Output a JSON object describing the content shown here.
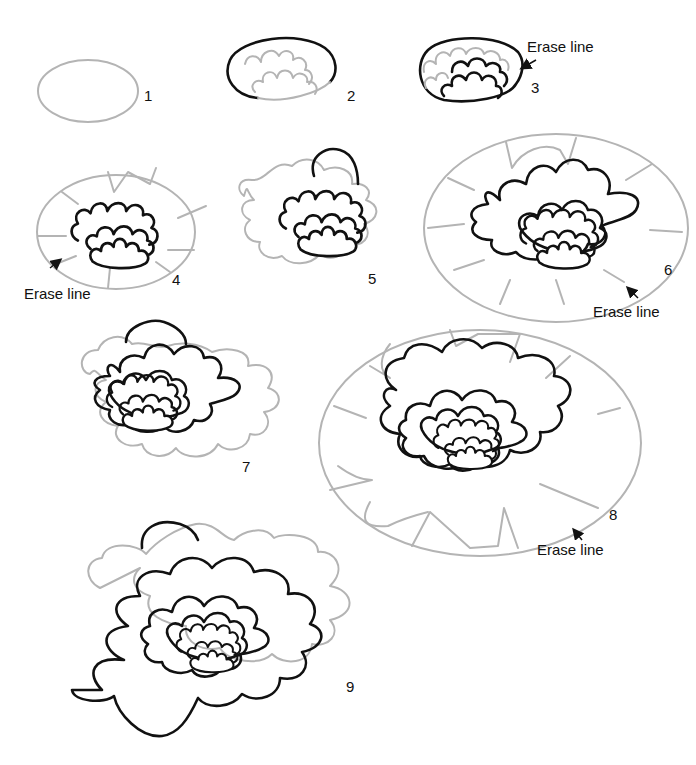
{
  "steps": [
    {
      "number": "1"
    },
    {
      "number": "2"
    },
    {
      "number": "3",
      "note": "Erase line"
    },
    {
      "number": "4",
      "note": "Erase line"
    },
    {
      "number": "5"
    },
    {
      "number": "6",
      "note": "Erase line"
    },
    {
      "number": "7"
    },
    {
      "number": "8",
      "note": "Erase line"
    },
    {
      "number": "9"
    }
  ],
  "colors": {
    "guide_line": "#b4b4b4",
    "ink_line": "#111111",
    "background": "#ffffff"
  }
}
